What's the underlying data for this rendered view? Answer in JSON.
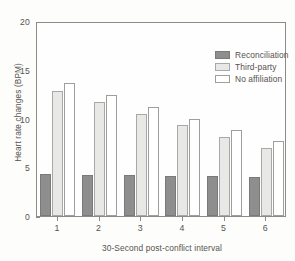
{
  "chart_data": {
    "type": "bar",
    "title": "",
    "xlabel": "30-Second post-conflict interval",
    "ylabel": "Heart rate changes (BPM)",
    "categories": [
      "1",
      "2",
      "3",
      "4",
      "5",
      "6"
    ],
    "ylim": [
      0,
      20
    ],
    "yticks": [
      0,
      5,
      10,
      15,
      20
    ],
    "ytick_labels": [
      "0",
      "5",
      "10",
      "15",
      "20"
    ],
    "grid": false,
    "legend_position": "top-right-inside",
    "series": [
      {
        "name": "Reconciliation",
        "color": "#8e8e8e",
        "values": [
          4.3,
          4.25,
          4.2,
          4.15,
          4.1,
          4.0
        ]
      },
      {
        "name": "Third-party",
        "color": "#e8e8e6",
        "values": [
          12.8,
          11.7,
          10.5,
          9.3,
          8.1,
          7.0
        ]
      },
      {
        "name": "No affiliation",
        "color": "#ffffff",
        "values": [
          13.6,
          12.4,
          11.2,
          10.0,
          8.8,
          7.7
        ]
      }
    ]
  }
}
